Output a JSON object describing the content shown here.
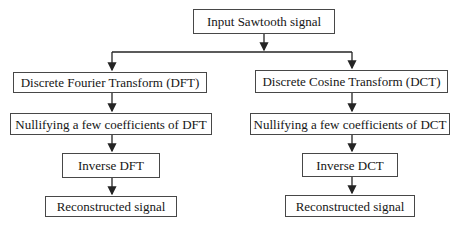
{
  "diagram": {
    "nodes": {
      "input": "Input Sawtooth signal",
      "dft": "Discrete Fourier Transform (DFT)",
      "dct": "Discrete Cosine Transform (DCT)",
      "nullify_dft": "Nullifying a few coefficients of DFT",
      "nullify_dct": "Nullifying a few coefficients of DCT",
      "inverse_dft": "Inverse DFT",
      "inverse_dct": "Inverse DCT",
      "reconstructed_left": "Reconstructed signal",
      "reconstructed_right": "Reconstructed signal"
    },
    "colors": {
      "border": "#474747",
      "text": "#161616",
      "arrow": "#242424",
      "background": "#ffffff"
    }
  }
}
